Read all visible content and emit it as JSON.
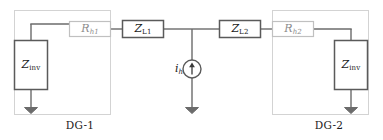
{
  "figure": {
    "type": "circuit-diagram",
    "width": 383,
    "height": 140,
    "background_color": "#ffffff"
  },
  "colors": {
    "wire": "#6b6b6b",
    "component_border": "#5a5a5a",
    "component_fill": "#ffffff",
    "dim_component_border": "#c0c0c0",
    "dim_component_text": "#8c8c8c",
    "enclosure_border": "#d3d3d3",
    "text": "#1a1a1a",
    "ground": "#6b6b6b"
  },
  "units": [
    {
      "id": "dg-1",
      "caption": "DG-1",
      "caption_x": 80,
      "caption_y": 120,
      "enclosure": {
        "x": 14,
        "y": 10,
        "width": 96,
        "height": 104
      },
      "inverter_impedance": {
        "label_base": "Z",
        "label_sub": "inv",
        "label_x": 31,
        "label_y": 65,
        "box": {
          "x": 14,
          "y": 40,
          "width": 34,
          "height": 50
        }
      },
      "resistor": {
        "label_base": "R",
        "label_sub": "h1",
        "dim": true,
        "label_x": 90,
        "label_y": 29,
        "box": {
          "x": 69,
          "y": 21,
          "width": 42,
          "height": 16
        }
      }
    },
    {
      "id": "dg-2",
      "caption": "DG-2",
      "caption_x": 329,
      "caption_y": 120,
      "enclosure": {
        "x": 272,
        "y": 10,
        "width": 96,
        "height": 104
      },
      "inverter_impedance": {
        "label_base": "Z",
        "label_sub": "inv",
        "label_x": 351,
        "label_y": 65,
        "box": {
          "x": 334,
          "y": 40,
          "width": 34,
          "height": 50
        }
      },
      "resistor": {
        "label_base": "R",
        "label_sub": "h2",
        "dim": true,
        "label_x": 293,
        "label_y": 29,
        "box": {
          "x": 272,
          "y": 21,
          "width": 42,
          "height": 16
        }
      }
    }
  ],
  "line_impedances": [
    {
      "id": "z-l1",
      "label_base": "Z",
      "label_sub": "L1",
      "label_x": 143,
      "label_y": 29,
      "box": {
        "x": 122,
        "y": 20,
        "width": 42,
        "height": 18
      }
    },
    {
      "id": "z-l2",
      "label_base": "Z",
      "label_sub": "L2",
      "label_x": 240,
      "label_y": 29,
      "box": {
        "x": 219,
        "y": 20,
        "width": 42,
        "height": 18
      }
    }
  ],
  "current_source": {
    "id": "harmonic-current-source",
    "label_base": "i",
    "label_sub": "h",
    "label_x": 176,
    "label_y": 69,
    "center_x": 192,
    "center_y": 69,
    "radius": 9,
    "arrow_direction": "up"
  },
  "grounds": [
    {
      "id": "ground-dg1",
      "x": 31,
      "y": 107
    },
    {
      "id": "ground-source",
      "x": 192,
      "y": 107
    },
    {
      "id": "ground-dg2",
      "x": 351,
      "y": 107
    }
  ],
  "main_rail": {
    "y": 29,
    "x_start": 111,
    "x_end": 272
  }
}
